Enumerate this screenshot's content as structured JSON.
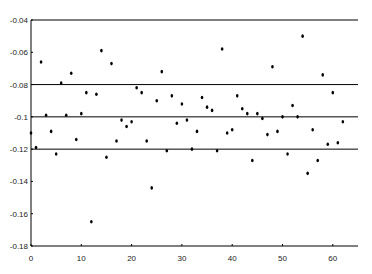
{
  "chart_data": {
    "type": "scatter",
    "title": "",
    "xlabel": "",
    "ylabel": "",
    "xlim": [
      0,
      65
    ],
    "ylim": [
      -0.18,
      -0.04
    ],
    "grid": false,
    "reference_lines": [
      -0.04,
      -0.08,
      -0.1,
      -0.12
    ],
    "x_ticks": [
      0,
      10,
      20,
      30,
      40,
      50,
      60
    ],
    "x_tick_labels": [
      "0",
      "10",
      "20",
      "30",
      "40",
      "50",
      "60"
    ],
    "y_ticks": [
      -0.04,
      -0.06,
      -0.08,
      -0.1,
      -0.12,
      -0.14,
      -0.16,
      -0.18
    ],
    "y_tick_labels": [
      "-0.04",
      "-0.06",
      "-0.08",
      "-0.1",
      "-0.12",
      "-0.14",
      "-0.16",
      "-0.18"
    ],
    "marker_color": "#000000",
    "line_color": "#000000",
    "series": [
      {
        "name": "data",
        "x": [
          0,
          1,
          2,
          3,
          4,
          5,
          6,
          7,
          8,
          9,
          10,
          11,
          12,
          13,
          14,
          15,
          16,
          17,
          18,
          19,
          20,
          21,
          22,
          23,
          24,
          25,
          26,
          27,
          28,
          29,
          30,
          31,
          32,
          33,
          34,
          35,
          36,
          37,
          38,
          39,
          40,
          41,
          42,
          43,
          44,
          45,
          46,
          47,
          48,
          49,
          50,
          51,
          52,
          53,
          54,
          55,
          56,
          57,
          58,
          59,
          60,
          61,
          62
        ],
        "y": [
          -0.11,
          -0.119,
          -0.066,
          -0.099,
          -0.109,
          -0.123,
          -0.079,
          -0.099,
          -0.073,
          -0.114,
          -0.098,
          -0.085,
          -0.165,
          -0.086,
          -0.059,
          -0.125,
          -0.067,
          -0.115,
          -0.102,
          -0.106,
          -0.103,
          -0.082,
          -0.085,
          -0.115,
          -0.144,
          -0.09,
          -0.072,
          -0.121,
          -0.087,
          -0.104,
          -0.092,
          -0.102,
          -0.12,
          -0.109,
          -0.088,
          -0.094,
          -0.096,
          -0.121,
          -0.058,
          -0.11,
          -0.108,
          -0.087,
          -0.095,
          -0.098,
          -0.127,
          -0.098,
          -0.101,
          -0.111,
          -0.069,
          -0.109,
          -0.1,
          -0.123,
          -0.093,
          -0.1,
          -0.05,
          -0.135,
          -0.108,
          -0.127,
          -0.074,
          -0.117,
          -0.085,
          -0.116,
          -0.103
        ]
      }
    ]
  }
}
